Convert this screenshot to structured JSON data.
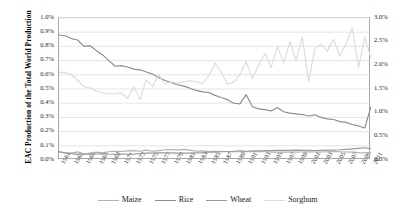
{
  "axis": {
    "y_left_title": "EAC Production of the Total World Production",
    "y_left_ticks": [
      "0.0%",
      "0.1%",
      "0.2%",
      "0.3%",
      "0.4%",
      "0.5%",
      "0.6%",
      "0.7%",
      "0.8%",
      "0.9%",
      "1.0%"
    ],
    "y_right_ticks": [
      "0.0%",
      "0.5%",
      "1.0%",
      "1.5%",
      "2.0%",
      "2.5%",
      "3.0%"
    ],
    "x_ticks": [
      "1961",
      "1963",
      "1965",
      "1967",
      "1969",
      "1971",
      "1973",
      "1975",
      "1977",
      "1979",
      "1981",
      "1983",
      "1985",
      "1987",
      "1989",
      "1991",
      "1993",
      "1995",
      "1997",
      "1999",
      "2001",
      "2003",
      "2005",
      "2007",
      "2009",
      "2011"
    ]
  },
  "legend": {
    "items": [
      {
        "label": "Maize",
        "color": "#b0b0b0"
      },
      {
        "label": "Rice",
        "color": "#8c8c8c"
      },
      {
        "label": "Wheat",
        "color": "#9a9a9a"
      },
      {
        "label": "Sorghum",
        "color": "#dcdcdc"
      }
    ]
  },
  "colors": {
    "maize": "#b0b0b0",
    "rice": "#8c8c8c",
    "wheat": "#9a9a9a",
    "sorghum": "#dcdcdc",
    "gridline": "#d9d9d9",
    "axis": "#a6a6a6",
    "background": "#ffffff"
  },
  "chart_data": {
    "type": "line",
    "title": "",
    "xlabel": "",
    "ylabel": "EAC Production of the Total World Production",
    "y_left_label": "EAC Production of the Total World Production",
    "y_right_label": "",
    "ylim": [
      0,
      1.0
    ],
    "y_right_lim": [
      0,
      3.0
    ],
    "y_unit": "%",
    "grid": "horizontal",
    "legend_position": "bottom",
    "x": [
      1961,
      1962,
      1963,
      1964,
      1965,
      1966,
      1967,
      1968,
      1969,
      1970,
      1971,
      1972,
      1973,
      1974,
      1975,
      1976,
      1977,
      1978,
      1979,
      1980,
      1981,
      1982,
      1983,
      1984,
      1985,
      1986,
      1987,
      1988,
      1989,
      1990,
      1991,
      1992,
      1993,
      1994,
      1995,
      1996,
      1997,
      1998,
      1999,
      2000,
      2001,
      2002,
      2003,
      2004,
      2005,
      2006,
      2007,
      2008,
      2009,
      2010,
      2011
    ],
    "series": [
      {
        "name": "Maize",
        "axis": "left",
        "color": "#b0b0b0",
        "values": [
          0.055,
          0.05,
          0.048,
          0.057,
          0.042,
          0.048,
          0.055,
          0.05,
          0.058,
          0.062,
          0.06,
          0.064,
          0.066,
          0.062,
          0.07,
          0.062,
          0.066,
          0.072,
          0.074,
          0.07,
          0.075,
          0.07,
          0.062,
          0.064,
          0.06,
          0.062,
          0.06,
          0.058,
          0.058,
          0.058,
          0.06,
          0.058,
          0.058,
          0.058,
          0.056,
          0.056,
          0.055,
          0.055,
          0.055,
          0.056,
          0.058,
          0.056,
          0.056,
          0.058,
          0.06,
          0.058,
          0.056,
          0.055,
          0.052,
          0.05,
          0.048
        ]
      },
      {
        "name": "Rice",
        "axis": "left",
        "color": "#8c8c8c",
        "values": [
          0.88,
          0.875,
          0.855,
          0.845,
          0.8,
          0.805,
          0.77,
          0.74,
          0.7,
          0.66,
          0.665,
          0.655,
          0.64,
          0.635,
          0.62,
          0.605,
          0.58,
          0.56,
          0.545,
          0.53,
          0.52,
          0.505,
          0.49,
          0.48,
          0.475,
          0.455,
          0.44,
          0.425,
          0.4,
          0.395,
          0.46,
          0.375,
          0.36,
          0.355,
          0.345,
          0.37,
          0.34,
          0.33,
          0.325,
          0.32,
          0.31,
          0.318,
          0.3,
          0.29,
          0.285,
          0.27,
          0.265,
          0.25,
          0.24,
          0.225,
          0.375
        ]
      },
      {
        "name": "Wheat",
        "axis": "left",
        "color": "#9a9a9a",
        "values": [
          0.06,
          0.05,
          0.045,
          0.04,
          0.042,
          0.04,
          0.042,
          0.045,
          0.042,
          0.04,
          0.042,
          0.04,
          0.042,
          0.045,
          0.048,
          0.048,
          0.05,
          0.05,
          0.05,
          0.048,
          0.048,
          0.048,
          0.05,
          0.052,
          0.055,
          0.055,
          0.058,
          0.06,
          0.062,
          0.065,
          0.062,
          0.065,
          0.064,
          0.066,
          0.066,
          0.068,
          0.068,
          0.068,
          0.07,
          0.068,
          0.068,
          0.066,
          0.068,
          0.07,
          0.07,
          0.072,
          0.075,
          0.078,
          0.082,
          0.086,
          0.08
        ]
      },
      {
        "name": "Sorghum",
        "axis": "right",
        "color": "#dcdcdc",
        "values": [
          1.85,
          1.85,
          1.8,
          1.68,
          1.55,
          1.52,
          1.45,
          1.42,
          1.4,
          1.4,
          1.42,
          1.3,
          1.55,
          1.28,
          1.7,
          1.55,
          1.8,
          1.6,
          1.65,
          1.62,
          1.65,
          1.68,
          1.65,
          1.62,
          1.78,
          2.05,
          1.85,
          1.6,
          1.65,
          1.8,
          2.08,
          1.72,
          2.0,
          2.25,
          1.95,
          2.4,
          2.05,
          2.5,
          2.1,
          2.6,
          1.65,
          2.35,
          2.45,
          2.3,
          2.55,
          2.2,
          2.45,
          2.8,
          1.95,
          2.6,
          2.15
        ]
      }
    ]
  }
}
